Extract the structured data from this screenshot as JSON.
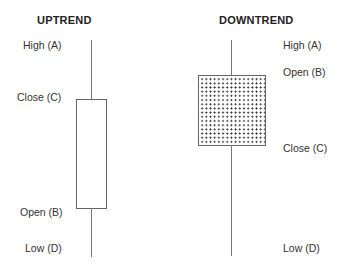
{
  "diagram": {
    "type": "candlestick-explanation",
    "uptrend": {
      "title": "UPTREND",
      "labels": {
        "high": "High (A)",
        "close": "Close (C)",
        "open": "Open (B)",
        "low": "Low (D)"
      },
      "body_fill": "white"
    },
    "downtrend": {
      "title": "DOWNTREND",
      "labels": {
        "high": "High (A)",
        "open": "Open (B)",
        "close": "Close (C)",
        "low": "Low (D)"
      },
      "body_fill": "dotted"
    }
  }
}
